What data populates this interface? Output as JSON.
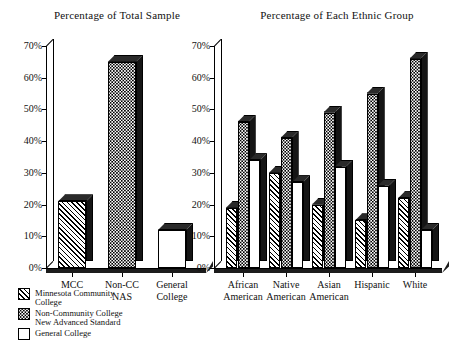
{
  "chart_data": [
    {
      "type": "bar",
      "title": "Percentage of Total Sample",
      "xlabel": "",
      "ylabel": "",
      "ylim": [
        0,
        70
      ],
      "yticks": [
        0,
        10,
        20,
        30,
        40,
        50,
        60,
        70
      ],
      "ytick_labels": [
        "0%",
        "10%",
        "20%",
        "30%",
        "40%",
        "50%",
        "60%",
        "70%"
      ],
      "grid": false,
      "legend_position": "below-left",
      "categories": [
        "MCC",
        "Non-CC\nNAS",
        "General\nCollege"
      ],
      "values": [
        21,
        65,
        12
      ],
      "bar_series": [
        "Minnesota Community College",
        "Non-Community College New Advanced Standard",
        "General College"
      ],
      "bars": [
        {
          "category": "MCC",
          "value": 21,
          "pattern": "hatch"
        },
        {
          "category": "Non-CC NAS",
          "value": 65,
          "pattern": "dots"
        },
        {
          "category": "General College",
          "value": 12,
          "pattern": "plain"
        }
      ]
    },
    {
      "type": "bar",
      "title": "Percentage of Each Ethnic Group",
      "xlabel": "",
      "ylabel": "",
      "ylim": [
        0,
        70
      ],
      "yticks": [
        0,
        10,
        20,
        30,
        40,
        50,
        60,
        70
      ],
      "ytick_labels": [
        "0%",
        "10%",
        "20%",
        "30%",
        "40%",
        "50%",
        "60%",
        "70%"
      ],
      "grid": false,
      "categories": [
        "African\nAmerican",
        "Native\nAmerican",
        "Asian\nAmerican",
        "Hispanic",
        "White"
      ],
      "series": [
        {
          "name": "Minnesota Community College",
          "pattern": "hatch",
          "values": [
            19,
            30,
            20,
            15,
            22
          ]
        },
        {
          "name": "Non-Community College New Advanced Standard",
          "pattern": "dots",
          "values": [
            46,
            41,
            49,
            55,
            66
          ]
        },
        {
          "name": "General College",
          "pattern": "plain",
          "values": [
            34,
            27,
            32,
            26,
            12
          ]
        }
      ]
    }
  ],
  "legend": {
    "items": [
      {
        "label": "Minnesota Community\nCollege",
        "pattern": "hatch"
      },
      {
        "label": "Non-Community College\nNew Advanced Standard",
        "pattern": "dots"
      },
      {
        "label": "General College",
        "pattern": "plain"
      }
    ]
  },
  "colors": {
    "bar_face": "#ffffff",
    "bar_side": "#151515",
    "bar_top": "#2a2a2a",
    "outline": "#000000",
    "background": "#ffffff",
    "text": "#111111"
  }
}
